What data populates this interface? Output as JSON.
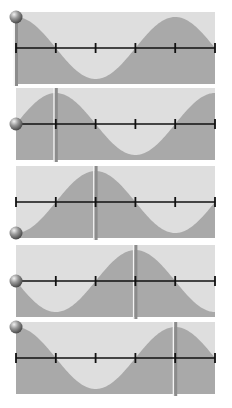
{
  "diagram": {
    "title": "",
    "colors": {
      "background": "#ffffff",
      "panel_bg": "#dedede",
      "wave_fill": "#a9a9a9",
      "axis": "#111111",
      "marker": "#8c8c8c",
      "marker_highlight": "#f4f4f4",
      "ball": "#9a9a9a"
    },
    "axis_ticks": 6,
    "wavelength_in_tick_intervals": 4,
    "panels": [
      {
        "id": 1,
        "phase_fraction": 0.0,
        "ball_position": "top",
        "marker_tick": 0
      },
      {
        "id": 2,
        "phase_fraction": 0.25,
        "ball_position": "middle",
        "marker_tick": 1
      },
      {
        "id": 3,
        "phase_fraction": 0.5,
        "ball_position": "bottom",
        "marker_tick": 2
      },
      {
        "id": 4,
        "phase_fraction": 0.75,
        "ball_position": "middle",
        "marker_tick": 3
      },
      {
        "id": 5,
        "phase_fraction": 1.0,
        "ball_position": "top",
        "marker_tick": 4
      }
    ]
  }
}
